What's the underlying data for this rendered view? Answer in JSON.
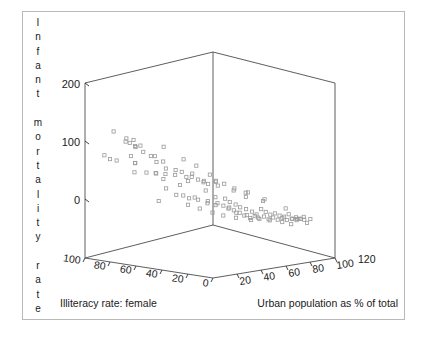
{
  "figure": {
    "background_color": "#ffffff",
    "frame_color": "#b9b9b9",
    "axis_color": "#4c4c4c",
    "marker_color": "#9a9a9a"
  },
  "ylabel_letters": "I\nn\nf\na\nn\nt\n\nm\no\nr\nt\na\nl\ni\nt\ny\n\nr\na\nt\ne",
  "chart_data": {
    "type": "scatter",
    "projection": "3d",
    "title": "",
    "zlabel": "Infant mortality rate",
    "xlabel": "Illiteracy rate: female",
    "ylabel": "Urban population as % of total",
    "grid": false,
    "legend": null,
    "zlim": [
      0,
      200
    ],
    "ztick_labels": [
      "200",
      "100",
      "0"
    ],
    "ztick_values": [
      200,
      100,
      0
    ],
    "xlim": [
      100,
      0
    ],
    "xtick_labels": [
      "100",
      "80",
      "60",
      "40",
      "20",
      "0"
    ],
    "xtick_values": [
      100,
      80,
      60,
      40,
      20,
      0
    ],
    "ylim": [
      0,
      120
    ],
    "ytick_labels": [
      "20",
      "40",
      "60",
      "80",
      "100",
      "120"
    ],
    "ytick_values": [
      20,
      40,
      60,
      80,
      100,
      120
    ],
    "points": [
      {
        "x": 84,
        "y": 8,
        "z": 168
      },
      {
        "x": 78,
        "y": 13,
        "z": 155
      },
      {
        "x": 77,
        "y": 11,
        "z": 148
      },
      {
        "x": 74,
        "y": 15,
        "z": 151
      },
      {
        "x": 73,
        "y": 10,
        "z": 143
      },
      {
        "x": 72,
        "y": 14,
        "z": 139
      },
      {
        "x": 71,
        "y": 18,
        "z": 141
      },
      {
        "x": 70,
        "y": 12,
        "z": 135
      },
      {
        "x": 92,
        "y": 9,
        "z": 132
      },
      {
        "x": 88,
        "y": 16,
        "z": 124
      },
      {
        "x": 86,
        "y": 7,
        "z": 121
      },
      {
        "x": 80,
        "y": 20,
        "z": 129
      },
      {
        "x": 79,
        "y": 23,
        "z": 118
      },
      {
        "x": 76,
        "y": 19,
        "z": 114
      },
      {
        "x": 68,
        "y": 17,
        "z": 128
      },
      {
        "x": 66,
        "y": 22,
        "z": 122
      },
      {
        "x": 64,
        "y": 25,
        "z": 112
      },
      {
        "x": 62,
        "y": 21,
        "z": 119
      },
      {
        "x": 60,
        "y": 27,
        "z": 137
      },
      {
        "x": 58,
        "y": 24,
        "z": 109
      },
      {
        "x": 82,
        "y": 26,
        "z": 105
      },
      {
        "x": 75,
        "y": 29,
        "z": 102
      },
      {
        "x": 69,
        "y": 31,
        "z": 98
      },
      {
        "x": 67,
        "y": 28,
        "z": 96
      },
      {
        "x": 63,
        "y": 33,
        "z": 104
      },
      {
        "x": 61,
        "y": 30,
        "z": 92
      },
      {
        "x": 57,
        "y": 35,
        "z": 99
      },
      {
        "x": 55,
        "y": 32,
        "z": 88
      },
      {
        "x": 53,
        "y": 36,
        "z": 94
      },
      {
        "x": 51,
        "y": 38,
        "z": 85
      },
      {
        "x": 50,
        "y": 34,
        "z": 113
      },
      {
        "x": 48,
        "y": 40,
        "z": 90
      },
      {
        "x": 46,
        "y": 37,
        "z": 82
      },
      {
        "x": 45,
        "y": 42,
        "z": 79
      },
      {
        "x": 44,
        "y": 39,
        "z": 101
      },
      {
        "x": 42,
        "y": 44,
        "z": 76
      },
      {
        "x": 40,
        "y": 41,
        "z": 71
      },
      {
        "x": 39,
        "y": 46,
        "z": 86
      },
      {
        "x": 38,
        "y": 43,
        "z": 68
      },
      {
        "x": 36,
        "y": 48,
        "z": 73
      },
      {
        "x": 71,
        "y": 36,
        "z": 54
      },
      {
        "x": 59,
        "y": 45,
        "z": 61
      },
      {
        "x": 54,
        "y": 50,
        "z": 57
      },
      {
        "x": 49,
        "y": 47,
        "z": 49
      },
      {
        "x": 47,
        "y": 52,
        "z": 66
      },
      {
        "x": 43,
        "y": 49,
        "z": 44
      },
      {
        "x": 41,
        "y": 54,
        "z": 52
      },
      {
        "x": 37,
        "y": 51,
        "z": 38
      },
      {
        "x": 35,
        "y": 56,
        "z": 47
      },
      {
        "x": 34,
        "y": 53,
        "z": 33
      },
      {
        "x": 33,
        "y": 58,
        "z": 41
      },
      {
        "x": 31,
        "y": 55,
        "z": 29
      },
      {
        "x": 30,
        "y": 60,
        "z": 36
      },
      {
        "x": 29,
        "y": 57,
        "z": 24
      },
      {
        "x": 28,
        "y": 62,
        "z": 31
      },
      {
        "x": 26,
        "y": 59,
        "z": 19
      },
      {
        "x": 25,
        "y": 64,
        "z": 27
      },
      {
        "x": 24,
        "y": 61,
        "z": 14
      },
      {
        "x": 22,
        "y": 66,
        "z": 22
      },
      {
        "x": 21,
        "y": 63,
        "z": 9
      },
      {
        "x": 20,
        "y": 68,
        "z": 17
      },
      {
        "x": 19,
        "y": 65,
        "z": 12
      },
      {
        "x": 18,
        "y": 70,
        "z": 26
      },
      {
        "x": 17,
        "y": 67,
        "z": 7
      },
      {
        "x": 16,
        "y": 72,
        "z": 21
      },
      {
        "x": 15,
        "y": 69,
        "z": 11
      },
      {
        "x": 14,
        "y": 74,
        "z": 16
      },
      {
        "x": 13,
        "y": 71,
        "z": 6
      },
      {
        "x": 12,
        "y": 76,
        "z": 18
      },
      {
        "x": 11,
        "y": 73,
        "z": 9
      },
      {
        "x": 10,
        "y": 78,
        "z": 14
      },
      {
        "x": 9,
        "y": 75,
        "z": 5
      },
      {
        "x": 8,
        "y": 80,
        "z": 12
      },
      {
        "x": 7,
        "y": 77,
        "z": 8
      },
      {
        "x": 6,
        "y": 82,
        "z": 16
      },
      {
        "x": 6,
        "y": 85,
        "z": 10
      },
      {
        "x": 5,
        "y": 79,
        "z": 4
      },
      {
        "x": 5,
        "y": 88,
        "z": 13
      },
      {
        "x": 4,
        "y": 83,
        "z": 7
      },
      {
        "x": 4,
        "y": 90,
        "z": 11
      },
      {
        "x": 3,
        "y": 86,
        "z": 6
      },
      {
        "x": 3,
        "y": 93,
        "z": 15
      },
      {
        "x": 2,
        "y": 89,
        "z": 9
      },
      {
        "x": 2,
        "y": 95,
        "z": 5
      },
      {
        "x": 2,
        "y": 74,
        "z": 20
      },
      {
        "x": 1,
        "y": 91,
        "z": 8
      },
      {
        "x": 1,
        "y": 97,
        "z": 12
      },
      {
        "x": 1,
        "y": 84,
        "z": 6
      },
      {
        "x": 27,
        "y": 45,
        "z": 63
      },
      {
        "x": 23,
        "y": 50,
        "z": 55
      },
      {
        "x": 32,
        "y": 43,
        "z": 70
      },
      {
        "x": 44,
        "y": 58,
        "z": 42
      },
      {
        "x": 38,
        "y": 63,
        "z": 35
      },
      {
        "x": 52,
        "y": 41,
        "z": 80
      },
      {
        "x": 56,
        "y": 38,
        "z": 74
      },
      {
        "x": 65,
        "y": 33,
        "z": 87
      },
      {
        "x": 48,
        "y": 55,
        "z": 46
      },
      {
        "x": 35,
        "y": 67,
        "z": 28
      },
      {
        "x": 30,
        "y": 71,
        "z": 23
      },
      {
        "x": 25,
        "y": 76,
        "z": 18
      },
      {
        "x": 20,
        "y": 81,
        "z": 13
      },
      {
        "x": 15,
        "y": 87,
        "z": 10
      },
      {
        "x": 12,
        "y": 92,
        "z": 7
      },
      {
        "x": 18,
        "y": 55,
        "z": 40
      },
      {
        "x": 22,
        "y": 48,
        "z": 50
      },
      {
        "x": 28,
        "y": 40,
        "z": 58
      },
      {
        "x": 60,
        "y": 52,
        "z": 60
      },
      {
        "x": 66,
        "y": 47,
        "z": 67
      },
      {
        "x": 70,
        "y": 42,
        "z": 78
      },
      {
        "x": 46,
        "y": 68,
        "z": 30
      },
      {
        "x": 40,
        "y": 73,
        "z": 25
      },
      {
        "x": 33,
        "y": 79,
        "z": 20
      },
      {
        "x": 58,
        "y": 60,
        "z": 45
      },
      {
        "x": 52,
        "y": 65,
        "z": 37
      },
      {
        "x": 64,
        "y": 56,
        "z": 53
      },
      {
        "x": 9,
        "y": 62,
        "z": 34
      },
      {
        "x": 7,
        "y": 58,
        "z": 28
      },
      {
        "x": 14,
        "y": 52,
        "z": 44
      },
      {
        "x": 11,
        "y": 46,
        "z": 39
      }
    ]
  },
  "axis_titles": {
    "x_title": "Illiteracy rate: female",
    "y_title": "Urban population as % of total"
  }
}
